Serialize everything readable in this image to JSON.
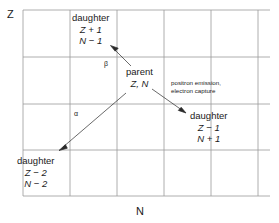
{
  "figure": {
    "type": "nuclide-chart-diagram",
    "axes": {
      "y_label": "Z",
      "x_label": "N"
    },
    "grid": {
      "vertical_lines_x": [
        23,
        70,
        117,
        164,
        211,
        258
      ],
      "horizontal_lines_y": [
        10,
        57,
        104,
        150,
        196
      ],
      "line_color": "#999999"
    },
    "nodes": {
      "parent": {
        "title": "parent",
        "line2": "Z, N"
      },
      "daughter_beta": {
        "title": "daughter",
        "line2": "Z + 1",
        "line3": "N − 1"
      },
      "daughter_ec": {
        "title": "daughter",
        "line2": "Z − 1",
        "line3": "N + 1"
      },
      "daughter_alpha": {
        "title": "daughter",
        "line2": "Z − 2",
        "line3": "N − 2"
      }
    },
    "annotations": {
      "beta_symbol": "β",
      "alpha_symbol": "α",
      "ec_process_line1": "positron emission,",
      "ec_process_line2": "electron capture"
    },
    "arrows": [
      {
        "name": "beta-decay-arrow",
        "from": [
          131,
          66
        ],
        "to": [
          112,
          47
        ]
      },
      {
        "name": "alpha-decay-arrow",
        "from": [
          126,
          93
        ],
        "to": [
          60,
          150
        ]
      },
      {
        "name": "ec-decay-arrow",
        "from": [
          152,
          89
        ],
        "to": [
          185,
          113
        ]
      }
    ],
    "colors": {
      "ink": "#1a1a1a",
      "grid": "#999999",
      "background": "#ffffff"
    }
  }
}
